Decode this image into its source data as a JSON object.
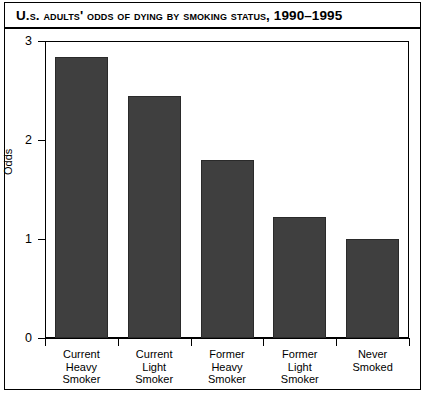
{
  "chart_data": {
    "type": "bar",
    "title": "U.S. Adults' Odds of Dying by Smoking Status, 1990–1995",
    "xlabel": "",
    "ylabel": "Odds",
    "categories": [
      "Current Heavy Smoker",
      "Current Light Smoker",
      "Former Heavy Smoker",
      "Former Light Smoker",
      "Never Smoked"
    ],
    "category_lines": [
      [
        "Current",
        "Heavy",
        "Smoker"
      ],
      [
        "Current",
        "Light",
        "Smoker"
      ],
      [
        "Former",
        "Heavy",
        "Smoker"
      ],
      [
        "Former",
        "Light",
        "Smoker"
      ],
      [
        "Never",
        "Smoked"
      ]
    ],
    "values": [
      2.84,
      2.44,
      1.8,
      1.22,
      1.0
    ],
    "ylim": [
      0,
      3
    ],
    "yticks": [
      0,
      1,
      2,
      3
    ],
    "ytick_labels": [
      "0",
      "1",
      "2",
      "3"
    ],
    "grid": false,
    "legend": null,
    "bar_color": "#3f3f3f",
    "bar_edge_color": "#2a2a2a",
    "axis_color": "#000000",
    "background_color": "#ffffff"
  }
}
